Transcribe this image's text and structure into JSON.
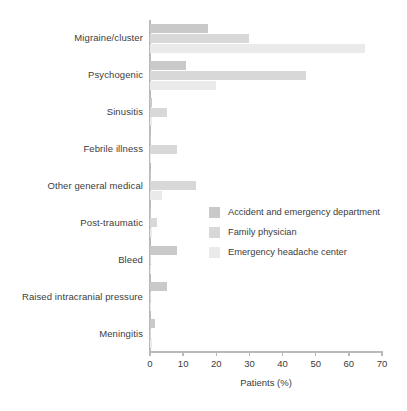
{
  "chart_data": {
    "type": "bar",
    "orientation": "horizontal",
    "grouped": true,
    "title": "",
    "subtitle": "",
    "xlabel": "Patients (%)",
    "ylabel": "",
    "xlim": [
      0,
      70
    ],
    "xticks": [
      0,
      10,
      20,
      30,
      40,
      50,
      60,
      70
    ],
    "xtick_labels": [
      "0",
      "10",
      "20",
      "30",
      "40",
      "50",
      "60",
      "70"
    ],
    "grid": false,
    "legend_position": "center-right-inside",
    "categories": [
      "Migraine/cluster",
      "Psychogenic",
      "Sinusitis",
      "Febrile illness",
      "Other general medical",
      "Post-traumatic",
      "Bleed",
      "Raised intracranial pressure",
      "Meningitis"
    ],
    "series": [
      {
        "name": "Accident and emergency department",
        "color": "#c9c9c9",
        "values": [
          17.5,
          11,
          0.5,
          0.3,
          0.3,
          0.3,
          8,
          5,
          1.5
        ]
      },
      {
        "name": "Family physician",
        "color": "#d8d8d8",
        "values": [
          30,
          47,
          5,
          8,
          14,
          2,
          0.3,
          0.3,
          0.3
        ]
      },
      {
        "name": "Emergency headache center",
        "color": "#eaeaea",
        "values": [
          65,
          20,
          0.5,
          0.2,
          3.5,
          0.5,
          0.2,
          0.2,
          0.5
        ]
      }
    ]
  },
  "legend": {
    "items": [
      {
        "label": "Accident and emergency department",
        "color": "#c9c9c9"
      },
      {
        "label": "Family physician",
        "color": "#d8d8d8"
      },
      {
        "label": "Emergency headache center",
        "color": "#eaeaea"
      }
    ]
  },
  "axis": {
    "x_title": "Patients (%)",
    "x_tick_labels": [
      "0",
      "10",
      "20",
      "30",
      "40",
      "50",
      "60",
      "70"
    ]
  }
}
